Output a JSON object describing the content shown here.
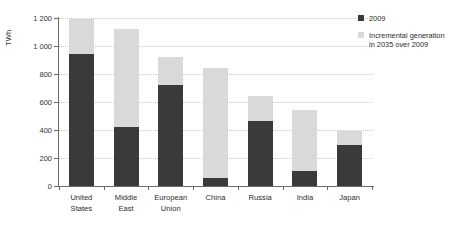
{
  "chart_data": {
    "type": "bar",
    "subtype": "stacked-bar",
    "title": "",
    "xlabel": "",
    "ylabel": "TWh",
    "ylim": [
      0,
      1200
    ],
    "yticks": [
      0,
      200,
      400,
      600,
      800,
      1000,
      1200
    ],
    "ytick_labels": [
      "0",
      "200",
      "400",
      "600",
      "800",
      "1 000",
      "1 200"
    ],
    "grid": true,
    "legend_position": "top-right",
    "categories": [
      "United States",
      "Middle East",
      "European Union",
      "China",
      "Russia",
      "India",
      "Japan"
    ],
    "category_labels": [
      [
        "United",
        "States"
      ],
      [
        "Middle",
        "East"
      ],
      [
        "European",
        "Union"
      ],
      [
        "China"
      ],
      [
        "Russia"
      ],
      [
        "India"
      ],
      [
        "Japan"
      ]
    ],
    "series": [
      {
        "name": "2009",
        "color": "#3a3a3a",
        "values": [
          945,
          425,
          720,
          60,
          465,
          110,
          290
        ]
      },
      {
        "name": "Incremental generation in 2035 over 2009",
        "color": "#d9d9d9",
        "values": [
          245,
          700,
          200,
          785,
          175,
          430,
          100
        ]
      }
    ],
    "totals": [
      1190,
      1125,
      920,
      845,
      640,
      540,
      390
    ]
  },
  "legend": {
    "items": [
      {
        "label": "2009",
        "color": "#3a3a3a"
      },
      {
        "label": "Incremental generation\nin 2035 over 2009",
        "color": "#d9d9d9"
      }
    ]
  },
  "colors": {
    "base": "#3a3a3a",
    "incremental": "#d9d9d9",
    "axis": "#6b6b6b",
    "grid": "#c9c9c9",
    "text": "#2b2b2b",
    "background": "#ffffff"
  }
}
